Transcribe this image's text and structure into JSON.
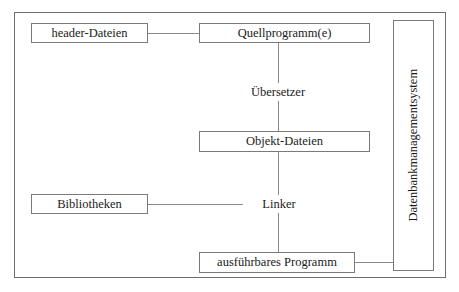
{
  "diagram": {
    "type": "flow-diagram",
    "language": "de",
    "colors": {
      "background": "#ffffff",
      "frame_border": "#6e6e6e",
      "box_border": "#7a7a7a",
      "connector": "#8a8a8a",
      "text": "#1a1a1a"
    },
    "nodes": {
      "header_dateien": {
        "label": "header-Dateien",
        "shape": "box"
      },
      "quellprogramm": {
        "label": "Quellprogramm(e)",
        "shape": "box"
      },
      "uebersetzer": {
        "label": "Übersetzer",
        "shape": "label"
      },
      "objekt_dateien": {
        "label": "Objekt-Dateien",
        "shape": "box"
      },
      "bibliotheken": {
        "label": "Bibliotheken",
        "shape": "box"
      },
      "linker": {
        "label": "Linker",
        "shape": "label"
      },
      "ausfuehrbares_programm": {
        "label": "ausführbares Programm",
        "shape": "box"
      },
      "dbms": {
        "label": "Datenbankmanagementsystem",
        "shape": "box",
        "orientation": "vertical"
      }
    },
    "edges": [
      {
        "from": "header_dateien",
        "to": "quellprogramm",
        "direction": "horizontal"
      },
      {
        "from": "quellprogramm",
        "to": "uebersetzer",
        "direction": "vertical"
      },
      {
        "from": "uebersetzer",
        "to": "objekt_dateien",
        "direction": "vertical"
      },
      {
        "from": "objekt_dateien",
        "to": "linker",
        "direction": "vertical"
      },
      {
        "from": "bibliotheken",
        "to": "linker",
        "direction": "horizontal"
      },
      {
        "from": "linker",
        "to": "ausfuehrbares_programm",
        "direction": "vertical"
      },
      {
        "from": "ausfuehrbares_programm",
        "to": "dbms",
        "direction": "horizontal"
      }
    ]
  }
}
